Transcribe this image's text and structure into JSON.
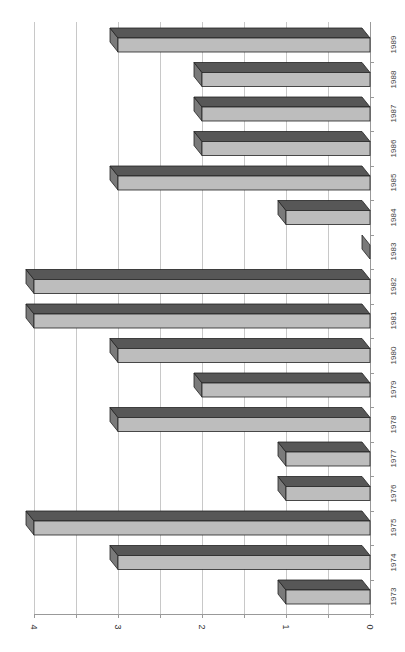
{
  "chart_data": {
    "type": "bar",
    "orientation": "horizontal-3d (rendered rotated 90°, value axis along bottom increasing right-to-left)",
    "title": "",
    "xlabel": "",
    "ylabel": "",
    "categories": [
      "1973",
      "1974",
      "1975",
      "1976",
      "1977",
      "1978",
      "1979",
      "1980",
      "1981",
      "1982",
      "1983",
      "1984",
      "1985",
      "1986",
      "1987",
      "1988",
      "1989"
    ],
    "values": [
      1,
      3,
      4,
      1,
      1,
      3,
      2,
      3,
      4,
      4,
      0,
      1,
      3,
      2,
      2,
      2,
      3
    ],
    "ylim": [
      0,
      4
    ],
    "value_ticks": [
      "0",
      "1",
      "2",
      "3",
      "4"
    ],
    "minor_gridlines": [
      0.5,
      1.5,
      2.5,
      3.5
    ],
    "grid": true,
    "legend": null,
    "colors": {
      "top_face": "#575757",
      "front_face": "#bdbdbd",
      "side_face": "#7a7a7a",
      "gridline": "#c8c8c8"
    }
  }
}
